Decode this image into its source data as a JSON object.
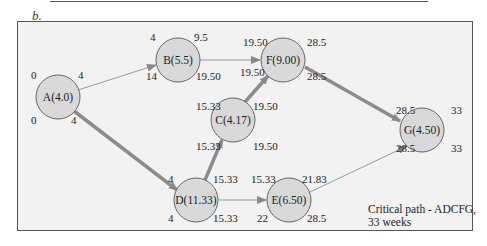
{
  "panel_label": "b.",
  "colors": {
    "frame_bg": "#f2f2f2",
    "node_fill": "#d9d9d9",
    "node_stroke": "#666666",
    "critical_edge": "#8c8c8c",
    "normal_edge": "#9a9a9a"
  },
  "nodes": [
    {
      "id": "A",
      "label": "A(4.0)",
      "es": "0",
      "ef": "4",
      "ls": "0",
      "lf": "4"
    },
    {
      "id": "B",
      "label": "B(5.5)",
      "es": "4",
      "ef": "9.5",
      "ls": "14",
      "lf": "19.50"
    },
    {
      "id": "C",
      "label": "C(4.17)",
      "es": "15.33",
      "ef": "19.50",
      "ls": "15.33",
      "lf": "19.50"
    },
    {
      "id": "D",
      "label": "D(11.33)",
      "es": "4",
      "ef": "15.33",
      "ls": "4",
      "lf": "15.33"
    },
    {
      "id": "E",
      "label": "E(6.50)",
      "es": "15.33",
      "ef": "21.83",
      "ls": "22",
      "lf": "28.5"
    },
    {
      "id": "F",
      "label": "F(9.00)",
      "es": "19.50",
      "ef": "28.5",
      "ls": "19.50",
      "lf": "28.5"
    },
    {
      "id": "G",
      "label": "G(4.50)",
      "es": "28.5",
      "ef": "33",
      "ls": "28.5",
      "lf": "33"
    }
  ],
  "edges": [
    {
      "from": "A",
      "to": "B",
      "critical": false
    },
    {
      "from": "A",
      "to": "D",
      "critical": true
    },
    {
      "from": "B",
      "to": "F",
      "critical": false
    },
    {
      "from": "D",
      "to": "C",
      "critical": true
    },
    {
      "from": "C",
      "to": "F",
      "critical": true
    },
    {
      "from": "D",
      "to": "E",
      "critical": false
    },
    {
      "from": "F",
      "to": "G",
      "critical": true
    },
    {
      "from": "E",
      "to": "G",
      "critical": false
    }
  ],
  "note": {
    "line1": "Critical path - ADCFG,",
    "line2": "33 weeks"
  }
}
